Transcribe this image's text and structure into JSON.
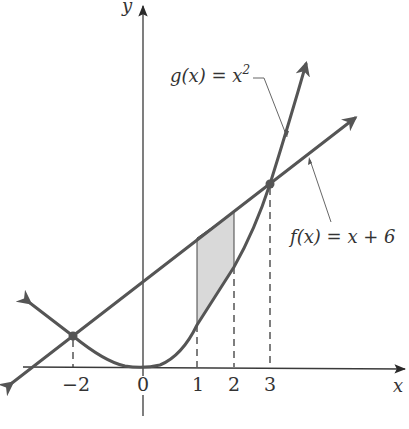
{
  "diagram": {
    "type": "function-graph",
    "axes": {
      "x_label": "x",
      "y_label": "y",
      "x_ticks": [
        {
          "value": -2,
          "label": "−2"
        },
        {
          "value": 0,
          "label": "0"
        },
        {
          "value": 1,
          "label": "1"
        },
        {
          "value": 2,
          "label": "2"
        },
        {
          "value": 3,
          "label": "3"
        }
      ]
    },
    "curves": [
      {
        "name": "g",
        "label": "g(x) = x²",
        "label_main": "g(x) = x",
        "label_sup": "2",
        "expression": "x^2"
      },
      {
        "name": "f",
        "label": "f(x) = x + 6",
        "expression": "x + 6"
      }
    ],
    "intersection_points": [
      {
        "x": -2,
        "y": 4
      },
      {
        "x": 3,
        "y": 9
      }
    ],
    "shaded_region": {
      "x_from": 1,
      "x_to": 2,
      "between": [
        "f",
        "g"
      ]
    },
    "colors": {
      "curve": "#555555",
      "axis": "#3a3a3a",
      "shade": "#d9d9d9"
    }
  }
}
